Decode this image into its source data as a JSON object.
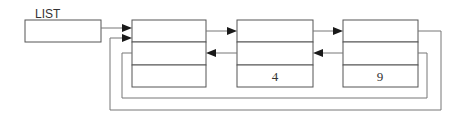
{
  "diagram": {
    "type": "circular doubly linked list",
    "head_pointer": {
      "label": "LIST"
    },
    "nodes": [
      {
        "id": "node-1",
        "fields": [
          "",
          "",
          ""
        ]
      },
      {
        "id": "node-2",
        "fields": [
          "",
          "",
          "4"
        ]
      },
      {
        "id": "node-3",
        "fields": [
          "",
          "",
          "9"
        ]
      }
    ],
    "edges": [
      {
        "from": "LIST",
        "to": "node-1",
        "kind": "head"
      },
      {
        "from": "node-1",
        "to": "node-2",
        "kind": "next"
      },
      {
        "from": "node-2",
        "to": "node-3",
        "kind": "next"
      },
      {
        "from": "node-2",
        "to": "node-1",
        "kind": "prev"
      },
      {
        "from": "node-3",
        "to": "node-2",
        "kind": "prev"
      },
      {
        "from": "node-3",
        "to": "node-1",
        "kind": "next-wrap"
      },
      {
        "from": "node-1",
        "to": "node-3",
        "kind": "prev-wrap"
      }
    ]
  }
}
